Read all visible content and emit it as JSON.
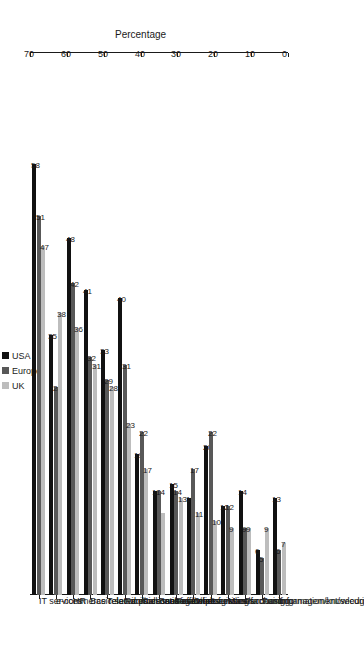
{
  "chart_data": {
    "type": "bar",
    "title": "",
    "xlabel": "",
    "ylabel": "Percentage",
    "ylim": [
      0,
      70
    ],
    "yticks": [
      0,
      10,
      20,
      30,
      40,
      50,
      60,
      70
    ],
    "grid": false,
    "orientation": "rotated-90",
    "legend_position": "top",
    "categories": [
      "IT services",
      "e-commerce related processes/activities",
      "HR",
      "Basic services",
      "Telecommunication services",
      "Facilities management",
      "Call centres",
      "Back office processing",
      "Financial services/accounting",
      "Other functions",
      "Logistics",
      "Manufacturing",
      "Purchasing",
      "Fund management/securities/asset management",
      "Information/knowledge management"
    ],
    "series": [
      {
        "name": "USA",
        "color": "#111111",
        "values": [
          58,
          35,
          48,
          41,
          33,
          40,
          19,
          14,
          15,
          13,
          20,
          12,
          14,
          6,
          13
        ]
      },
      {
        "name": "Europe",
        "color": "#585858",
        "values": [
          51,
          28,
          42,
          32,
          29,
          31,
          22,
          14,
          14,
          17,
          22,
          12,
          9,
          5,
          6
        ]
      },
      {
        "name": "UK",
        "color": "#bdbdbd",
        "values": [
          47,
          38,
          36,
          31,
          28,
          23,
          17,
          11,
          13,
          11,
          10,
          9,
          9,
          9,
          7
        ]
      }
    ],
    "value_labels": {
      "USA": [
        "58",
        "35",
        "48",
        "41",
        "33",
        "40",
        "19",
        "14",
        "15",
        "13",
        "20",
        "12",
        "14",
        "6",
        "13"
      ],
      "Europe": [
        "51",
        "28",
        "42",
        "32",
        "29",
        "31",
        "22",
        "14",
        "14",
        "17",
        "22",
        "12",
        "9",
        "5",
        "6"
      ],
      "UK": [
        "47",
        "38",
        "36",
        "31",
        "28",
        "23",
        "17",
        "",
        "13",
        "11",
        "10",
        "9",
        "9",
        "9",
        "7"
      ]
    }
  },
  "legend": {
    "items": [
      {
        "label": "USA",
        "color": "#111111"
      },
      {
        "label": "Europe",
        "color": "#585858"
      },
      {
        "label": "UK",
        "color": "#bdbdbd"
      }
    ]
  },
  "axis": {
    "percentage_title": "Percentage",
    "tick_labels": [
      "0",
      "10",
      "20",
      "30",
      "40",
      "50",
      "60",
      "70"
    ]
  }
}
